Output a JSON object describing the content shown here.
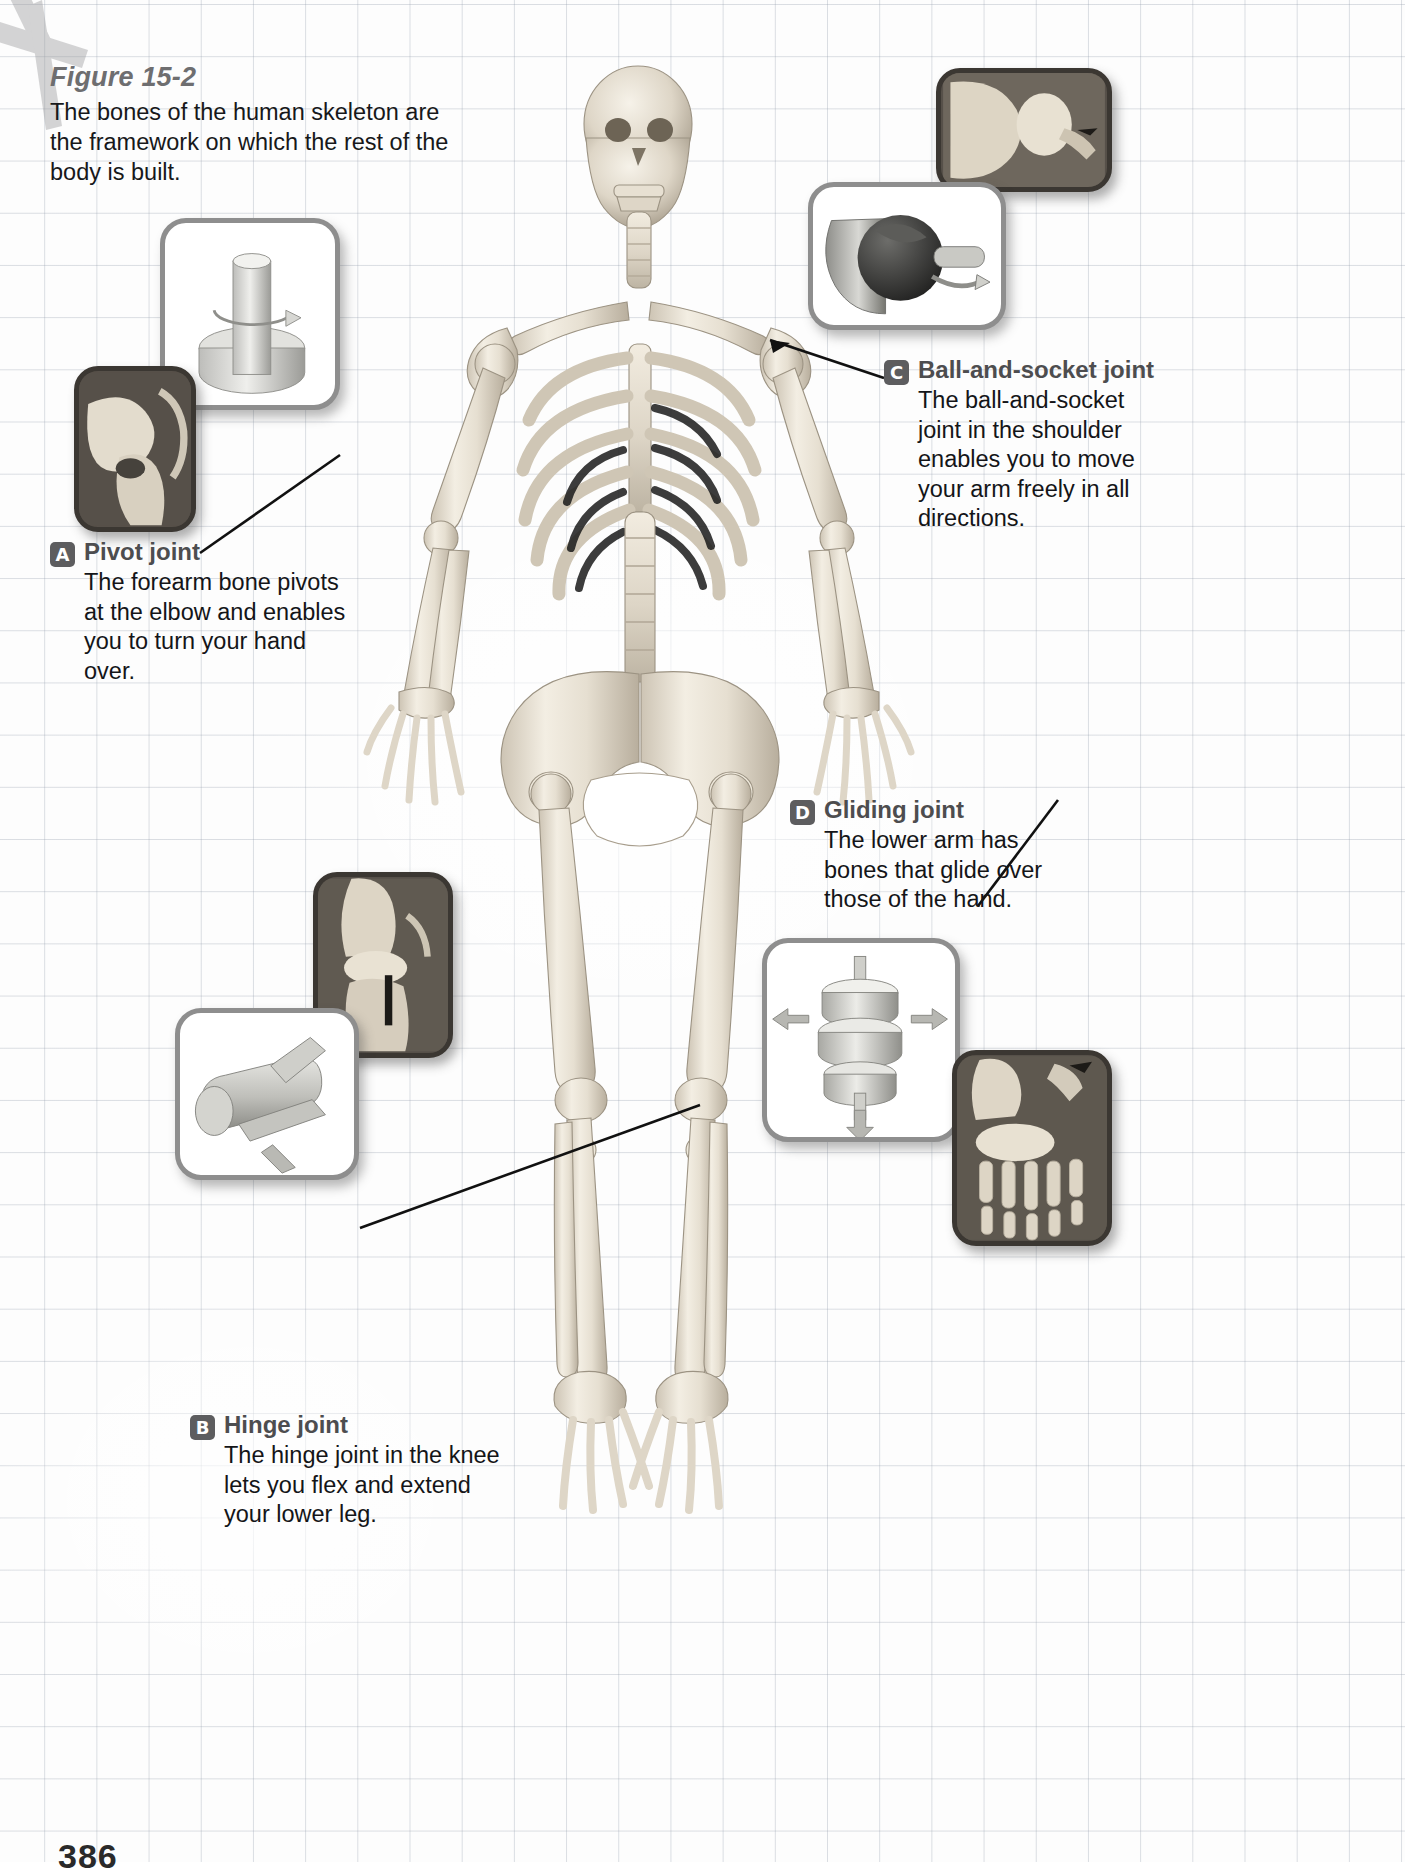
{
  "figure": {
    "title": "Figure 15-2",
    "description": "The bones of the human skeleton are the framework on which the rest of the body is built."
  },
  "page_number": "386",
  "colors": {
    "grid_line": "#96a0af",
    "title_gray": "#6e6e70",
    "caption_title_gray": "#4d4d4f",
    "badge_gray": "#5d5d5f",
    "body_text": "#141518",
    "panel_border_light": "#8e8e8e",
    "panel_border_dark": "#3b3732",
    "panel_photo_bg": "#565049",
    "bone_light": "#efe9dc",
    "bone_shadow": "#b9b0a0",
    "leader_line": "#111111"
  },
  "captions": [
    {
      "id": "A",
      "badge": "A",
      "title": "Pivot joint",
      "body": "The forearm bone pivots at the elbow and enables you to turn your hand over."
    },
    {
      "id": "B",
      "badge": "B",
      "title": "Hinge joint",
      "body": "The hinge joint in the knee lets you flex and extend your lower leg."
    },
    {
      "id": "C",
      "badge": "C",
      "title": "Ball-and-socket joint",
      "body": "The ball-and-socket joint in the shoulder enables you to move your arm freely in all directions."
    },
    {
      "id": "D",
      "badge": "D",
      "title": "Gliding joint",
      "body": "The lower arm has bones that glide over those of the hand."
    }
  ],
  "panels": [
    {
      "id": "pivot-model",
      "kind": "model",
      "depicts": "pivot-joint-model-cylinder-in-collar"
    },
    {
      "id": "pivot-photo",
      "kind": "photo",
      "depicts": "elbow-bone-photograph"
    },
    {
      "id": "ball-socket-photo",
      "kind": "photo",
      "depicts": "shoulder-joint-bone-photograph"
    },
    {
      "id": "ball-socket-model",
      "kind": "model",
      "depicts": "ball-and-socket-model-sphere-in-cup"
    },
    {
      "id": "hinge-photo",
      "kind": "photo",
      "depicts": "knee-joint-bone-photograph"
    },
    {
      "id": "hinge-model",
      "kind": "model",
      "depicts": "hinge-joint-model-pin-in-cylinder"
    },
    {
      "id": "gliding-model",
      "kind": "model",
      "depicts": "gliding-joint-model-stacked-discs"
    },
    {
      "id": "gliding-photo",
      "kind": "photo",
      "depicts": "wrist-and-hand-bones-photograph"
    }
  ],
  "illustration": {
    "subject": "human-skeleton-anterior-view",
    "label": "Full anterior view of the articulated human skeleton"
  }
}
